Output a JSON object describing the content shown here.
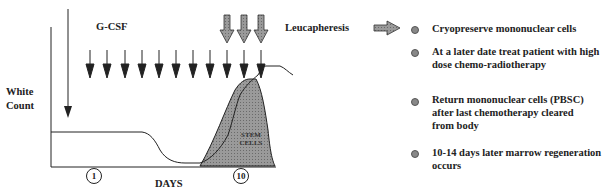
{
  "diagram": {
    "ylabel": [
      "White",
      "Count"
    ],
    "xlabel": "DAYS",
    "drug_label": "G-CSF",
    "procedure_label": "Leucapheresis",
    "area_label": [
      "STEM",
      "CELLS"
    ],
    "day_markers": [
      "1",
      "10"
    ],
    "gcsf_arrow_count": 11,
    "leucapheresis_arrow_count": 3
  },
  "steps": [
    {
      "text": "Cryopreserve mononuclear cells"
    },
    {
      "text": "At a later date treat patient with high dose chemo-radiotherapy"
    },
    {
      "text": "Return mononuclear cells (PBSC) after last chemotherapy cleared from body"
    },
    {
      "text": "10-14 days later marrow regeneration occurs"
    }
  ],
  "colors": {
    "line": "#222222",
    "area_fill": "#8a8a8a",
    "bullet": "#888888"
  }
}
